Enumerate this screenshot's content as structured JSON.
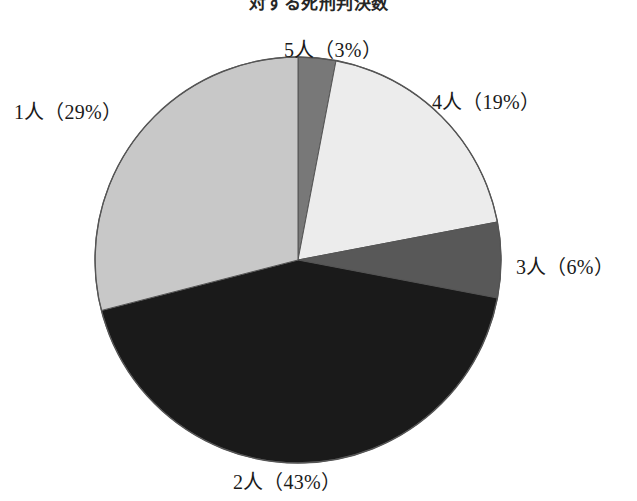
{
  "chart_data": {
    "type": "pie",
    "title": "対する死刑判決数",
    "xlabel": "",
    "ylabel": "",
    "legend_position": "none",
    "grid": false,
    "labels_outside": true,
    "start_angle_deg": 0,
    "direction": "clockwise",
    "categories": [
      "5人",
      "4人",
      "3人",
      "2人",
      "1人"
    ],
    "values": [
      3,
      19,
      6,
      43,
      29
    ],
    "unit": "%",
    "data_labels": [
      "5人（3%）",
      "4人（19%）",
      "3人（6%）",
      "2人（43%）",
      "1人（29%）"
    ],
    "slices": [
      {
        "name": "5人",
        "percent": 3,
        "label": "5人（3%）",
        "color": "#787878"
      },
      {
        "name": "4人",
        "percent": 19,
        "label": "4人（19%）",
        "color": "#ececec"
      },
      {
        "name": "3人",
        "percent": 6,
        "label": "3人（6%）",
        "color": "#585858"
      },
      {
        "name": "2人",
        "percent": 43,
        "label": "2人（43%）",
        "color": "#1a1a1a"
      },
      {
        "name": "1人",
        "percent": 29,
        "label": "1人（29%）",
        "color": "#c8c8c8"
      }
    ],
    "colors": {
      "slice_5": "#787878",
      "slice_4": "#ececec",
      "slice_3": "#585858",
      "slice_2": "#1a1a1a",
      "slice_1": "#c8c8c8",
      "outline": "#555555",
      "background": "#ffffff",
      "text": "#1a1a1a"
    },
    "geometry": {
      "center_x": 298,
      "center_y": 260,
      "radius": 203
    }
  }
}
